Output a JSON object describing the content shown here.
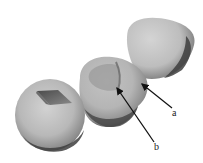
{
  "figure": {
    "type": "3d-rendered-specimens",
    "objects": [
      {
        "id": "left-specimen",
        "feature": "dark-rhomboid-cavity"
      },
      {
        "id": "middle-specimen",
        "feature": "inner-depression"
      },
      {
        "id": "right-specimen",
        "feature": "rounded-triangular-body"
      }
    ],
    "annotations": [
      {
        "label": "a",
        "points_to": "middle-specimen-right-edge"
      },
      {
        "label": "b",
        "points_to": "middle-specimen-inner-ridge"
      }
    ],
    "colors": {
      "background": "#ffffff",
      "specimen_light": "#c9c9c9",
      "specimen_mid": "#a8a8a8",
      "specimen_dark": "#555555",
      "arrow": "#111111"
    }
  }
}
